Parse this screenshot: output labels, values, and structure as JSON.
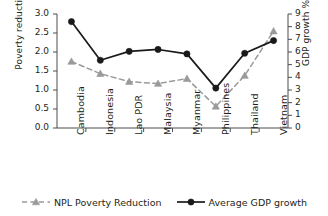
{
  "chart_data": {
    "type": "line",
    "title": "",
    "xlabel": "",
    "categories": [
      "Cambodia",
      "Indonesia",
      "Lao PDR",
      "Malaysia",
      "Myanmar",
      "Philippines",
      "Thailand",
      "Vietnam"
    ],
    "grid": false,
    "legend_position": "bottom",
    "axes": {
      "left": {
        "label": "Poverty reduction",
        "ylim": [
          0.0,
          3.0
        ],
        "ticks": [
          "0.0",
          "0.5",
          "1.0",
          "1.5",
          "2.0",
          "2.5",
          "3.0"
        ],
        "tick_values": [
          0.0,
          0.5,
          1.0,
          1.5,
          2.0,
          2.5,
          3.0
        ]
      },
      "right": {
        "label": "GDP growth %",
        "ylim": [
          0,
          9
        ],
        "ticks": [
          "0",
          "1",
          "2",
          "3",
          "4",
          "5",
          "6",
          "7",
          "8",
          "9"
        ],
        "tick_values": [
          0,
          1,
          2,
          3,
          4,
          5,
          6,
          7,
          8,
          9
        ]
      }
    },
    "series": [
      {
        "name": "NPL Poverty Reduction",
        "axis": "left",
        "color": "#9a9a9a",
        "marker": "triangle",
        "linestyle": "dashed",
        "values": [
          1.75,
          1.43,
          1.22,
          1.17,
          1.3,
          0.57,
          1.38,
          2.55
        ]
      },
      {
        "name": "Average GDP growth",
        "axis": "right",
        "color": "#1a1a1a",
        "marker": "circle",
        "linestyle": "solid",
        "values": [
          8.4,
          5.35,
          6.05,
          6.2,
          5.85,
          3.15,
          5.9,
          6.9
        ]
      }
    ]
  }
}
